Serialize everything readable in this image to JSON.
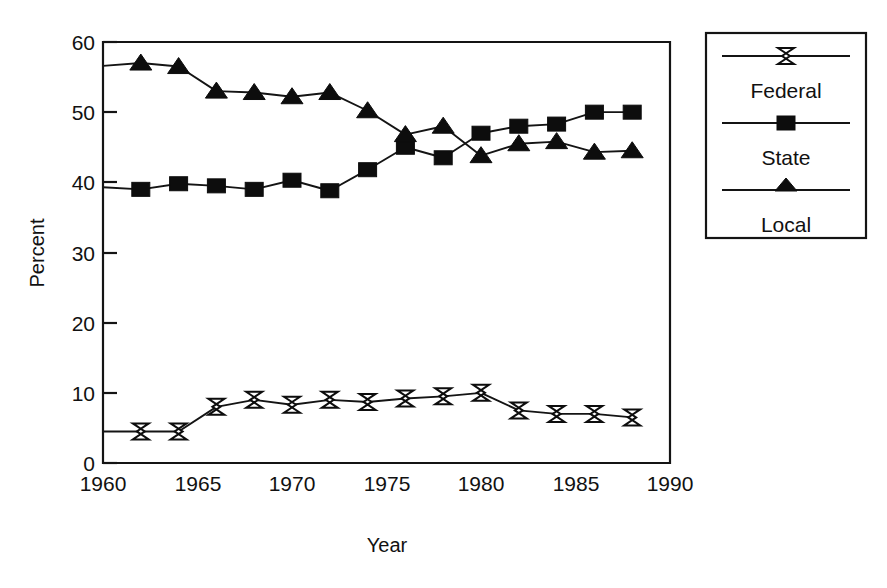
{
  "chart_data": {
    "type": "line",
    "title": "",
    "xlabel": "Year",
    "ylabel": "Percent",
    "xlim": [
      1960,
      1990
    ],
    "ylim": [
      0,
      60
    ],
    "xticks": [
      1960,
      1965,
      1970,
      1975,
      1980,
      1985,
      1990
    ],
    "yticks": [
      0,
      10,
      20,
      30,
      40,
      50,
      60
    ],
    "grid": false,
    "legend_position": "right-outside",
    "x": [
      1962,
      1964,
      1966,
      1968,
      1970,
      1972,
      1974,
      1976,
      1978,
      1980,
      1982,
      1984,
      1986,
      1988
    ],
    "series": [
      {
        "name": "Federal",
        "marker": "bowtie",
        "values": [
          4.5,
          4.5,
          8.0,
          9.0,
          8.3,
          9.0,
          8.7,
          9.2,
          9.5,
          10.0,
          7.5,
          7.0,
          7.0,
          6.5
        ]
      },
      {
        "name": "State",
        "marker": "square",
        "values": [
          39.0,
          39.8,
          39.5,
          39.0,
          40.3,
          38.8,
          41.8,
          45.0,
          43.5,
          47.0,
          48.0,
          48.3,
          50.0,
          50.0
        ]
      },
      {
        "name": "Local",
        "marker": "triangle",
        "values": [
          57.0,
          56.5,
          53.0,
          52.8,
          52.2,
          52.8,
          50.2,
          46.8,
          48.0,
          43.8,
          45.5,
          45.8,
          44.3,
          44.5
        ]
      }
    ],
    "line_start_values": {
      "Federal": 4.5,
      "State": 39.3,
      "Local": 56.6
    }
  },
  "axes": {
    "y_title": "Percent",
    "x_title": "Year",
    "x_tick_labels": [
      "1960",
      "1965",
      "1970",
      "1975",
      "1980",
      "1985",
      "1990"
    ],
    "y_tick_labels": [
      "0",
      "10",
      "20",
      "30",
      "40",
      "50",
      "60"
    ]
  },
  "legend": {
    "entries": [
      {
        "label": "Federal",
        "marker": "bowtie-marker"
      },
      {
        "label": "State",
        "marker": "square-marker"
      },
      {
        "label": "Local",
        "marker": "triangle-marker"
      }
    ]
  },
  "colors": {
    "ink": "#141414",
    "background": "#ffffff",
    "marker_fill": "#0d0d0d",
    "marker_open_fill": "#ffffff"
  }
}
